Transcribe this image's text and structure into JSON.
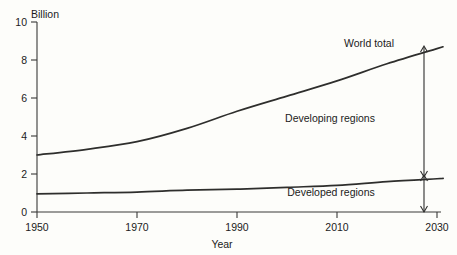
{
  "chart_data": {
    "type": "line",
    "title": "",
    "subtitle": "",
    "xlabel": "Year",
    "ylabel": "Billion",
    "xlim": [
      1950,
      2030
    ],
    "ylim": [
      0,
      10
    ],
    "grid": false,
    "legend_position": "inline-annotations",
    "xticks": [
      "1950",
      "1970",
      "1990",
      "2010",
      "2030"
    ],
    "xtick_values": [
      1950,
      1970,
      1990,
      2010,
      2030
    ],
    "yticks": [
      "0",
      "2",
      "4",
      "6",
      "8",
      "10"
    ],
    "ytick_values": [
      0,
      2,
      4,
      6,
      8,
      10
    ],
    "x": [
      1950,
      1960,
      1970,
      1980,
      1990,
      2000,
      2010,
      2020,
      2030
    ],
    "series": [
      {
        "name": "World total",
        "values": [
          3.0,
          3.3,
          3.7,
          4.4,
          5.3,
          6.1,
          6.9,
          7.8,
          8.6
        ]
      },
      {
        "name": "Developed regions",
        "values": [
          0.95,
          1.0,
          1.05,
          1.15,
          1.2,
          1.3,
          1.4,
          1.6,
          1.75
        ]
      }
    ],
    "annotations": [
      {
        "name": "world-total",
        "text": "World total",
        "x": 2007,
        "y": 8.9
      },
      {
        "name": "developing-regions",
        "text": "Developing regions",
        "x": 1998,
        "y": 5.1
      },
      {
        "name": "developed-regions",
        "text": "Developed regions",
        "x": 1998,
        "y": 1.0
      }
    ],
    "bracket": {
      "x": 2028,
      "developing_top": 8.55,
      "developing_bottom": 1.75,
      "developed_top": 1.75,
      "developed_bottom": 0
    },
    "colors": {
      "line": "#2e2e2c",
      "axis": "#3a3a38",
      "text": "#1b1b1a",
      "background": "#fdfdfa"
    }
  },
  "axes": {
    "y_axis_title": "Billion",
    "x_axis_title": "Year"
  },
  "labels": {
    "world_total": "World total",
    "developing_regions": "Developing regions",
    "developed_regions": "Developed regions",
    "y0": "0",
    "y2": "2",
    "y4": "4",
    "y6": "6",
    "y8": "8",
    "y10": "10",
    "x1950": "1950",
    "x1970": "1970",
    "x1990": "1990",
    "x2010": "2010",
    "x2030": "2030"
  }
}
